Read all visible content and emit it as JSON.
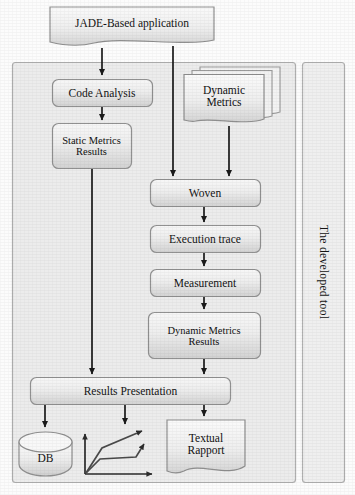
{
  "figure": {
    "type": "flowchart-diagram"
  },
  "palette": {
    "box_fill_light": "#f2f2f2",
    "box_fill_dark": "#d9d9d9",
    "box_stroke": "#9a9a9a",
    "panel_fill": "#ececec",
    "panel_stroke": "#b4b4b4",
    "arrow": "#1a1a1a",
    "page_bg": "#fcfcfc",
    "text": "#141414"
  },
  "nodes": {
    "jade_application": {
      "label": "JADE-Based application",
      "shape": "document"
    },
    "code_analysis": {
      "label": "Code Analysis",
      "shape": "rounded-rect"
    },
    "static_metrics_results": {
      "label": "Static Metrics\nResults",
      "line1": "Static Metrics",
      "line2": "Results",
      "shape": "rounded-rect"
    },
    "dynamic_metrics": {
      "label": "Dynamic\nMetrics",
      "line1": "Dynamic",
      "line2": "Metrics",
      "shape": "stacked-documents"
    },
    "woven": {
      "label": "Woven",
      "shape": "rounded-rect"
    },
    "execution_trace": {
      "label": "Execution trace",
      "shape": "rounded-rect"
    },
    "measurement": {
      "label": "Measurement",
      "shape": "rounded-rect"
    },
    "dynamic_metrics_results": {
      "label": "Dynamic Metrics\nResults",
      "line1": "Dynamic Metrics",
      "line2": "Results",
      "shape": "rounded-rect"
    },
    "results_presentation": {
      "label": "Results Presentation",
      "shape": "rounded-rect"
    },
    "db": {
      "label": "DB",
      "shape": "cylinder"
    },
    "chart": {
      "label": "",
      "shape": "line-chart-icon"
    },
    "textual_rapport": {
      "label": "Textual\nRapport",
      "line1": "Textual",
      "line2": "Rapport",
      "shape": "document"
    }
  },
  "panels": {
    "tool_boundary": {
      "label": ""
    },
    "developed_tool": {
      "label": "The developed tool",
      "orientation": "vertical"
    }
  },
  "edges": [
    {
      "from": "jade_application",
      "to": "code_analysis"
    },
    {
      "from": "jade_application",
      "to": "woven"
    },
    {
      "from": "code_analysis",
      "to": "static_metrics_results"
    },
    {
      "from": "dynamic_metrics",
      "to": "woven"
    },
    {
      "from": "woven",
      "to": "execution_trace"
    },
    {
      "from": "execution_trace",
      "to": "measurement"
    },
    {
      "from": "measurement",
      "to": "dynamic_metrics_results"
    },
    {
      "from": "dynamic_metrics_results",
      "to": "results_presentation"
    },
    {
      "from": "static_metrics_results",
      "to": "results_presentation"
    },
    {
      "from": "results_presentation",
      "to": "db"
    },
    {
      "from": "results_presentation",
      "to": "chart"
    },
    {
      "from": "results_presentation",
      "to": "textual_rapport"
    }
  ]
}
